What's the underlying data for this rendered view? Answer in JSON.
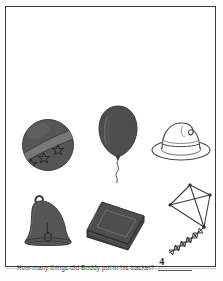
{
  "worksheet": {
    "title": "Counting worksheet page",
    "question": "How many things did Buddy put in his basket?",
    "answer": "4",
    "answer_blank_label": "answer-blank",
    "frame_color": "#3a3a3a",
    "page_color": "#ffffff",
    "ink_color": "#2b2b2b",
    "fill_color": "#555555",
    "outline_color": "#4a4a4a"
  },
  "objects": [
    {
      "id": "ball",
      "name": "ball",
      "style": "filled",
      "detail": "striped band with stars",
      "row": 1,
      "column": 1
    },
    {
      "id": "balloon",
      "name": "balloon",
      "style": "filled",
      "detail": "wavy string",
      "row": 1,
      "column": 2
    },
    {
      "id": "hat",
      "name": "hat",
      "style": "outline",
      "detail": "fedora with band",
      "row": 1,
      "column": 3
    },
    {
      "id": "bell",
      "name": "bell",
      "style": "filled",
      "detail": "loop on top and clapper",
      "row": 2,
      "column": 1
    },
    {
      "id": "book",
      "name": "book",
      "style": "filled",
      "detail": "closed book with cover panel",
      "row": 2,
      "column": 2
    },
    {
      "id": "kite",
      "name": "kite",
      "style": "outline",
      "detail": "diamond kite with bow tail",
      "row": 2,
      "column": 3
    }
  ],
  "counts": {
    "objects_shown": 6,
    "answer_written": "4"
  }
}
